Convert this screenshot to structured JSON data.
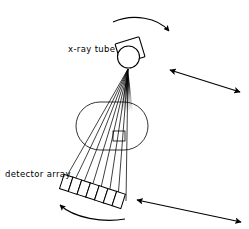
{
  "figure": {
    "type": "schematic-diagram",
    "width": 249,
    "height": 229,
    "background_color": "#ffffff",
    "stroke_color": "#000000"
  },
  "labels": {
    "xray_tube": "x-ray tube",
    "detector_array": "detector array"
  },
  "components": {
    "xray_tube": {
      "name": "x-ray tube",
      "shape": "circle-with-tilted-housing",
      "circle_center": [
        129,
        57
      ],
      "circle_radius": 11,
      "focal_spot": [
        128,
        70
      ],
      "housing_rotation_deg": -18
    },
    "fan_beam": {
      "name": "fan beam",
      "apex": [
        128,
        70
      ],
      "ray_count": 8,
      "wedge_fill": "#000000",
      "wedge_note": "solid black near apex fading into discrete rays"
    },
    "patient_body": {
      "name": "patient body outline",
      "shape": "stadium",
      "bounds": [
        76,
        102,
        72,
        48
      ],
      "stroke_color": "#000000"
    },
    "object_of_interest": {
      "name": "object inside body",
      "shape": "small-rectangle",
      "bounds": [
        113,
        131,
        12,
        10
      ]
    },
    "detector_array": {
      "name": "detector array",
      "cell_count": 7,
      "start": [
        62,
        181
      ],
      "end": [
        124,
        201
      ],
      "rotation_deg": 18
    }
  },
  "annotations": {
    "rotation_arrows": [
      {
        "name": "top-rotation-arrow",
        "style": "curved",
        "direction": "clockwise",
        "head_at": [
          168,
          33
        ]
      },
      {
        "name": "bottom-rotation-arrow",
        "style": "curved",
        "direction": "counter-clockwise",
        "head_at": [
          58,
          206
        ]
      }
    ],
    "translation_arrows": [
      {
        "name": "upper-translation-arrow",
        "style": "straight-double-headed",
        "from": [
          168,
          70
        ],
        "to": [
          241,
          92
        ]
      },
      {
        "name": "lower-translation-arrow",
        "style": "straight-double-headed",
        "from": [
          135,
          200
        ],
        "to": [
          243,
          223
        ]
      }
    ]
  }
}
